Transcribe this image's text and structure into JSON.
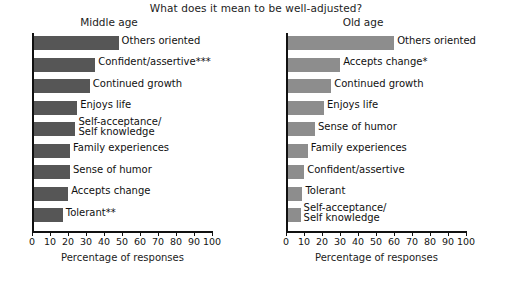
{
  "title": "What does it mean to be well-adjusted?",
  "axis": {
    "xlabel": "Percentage of responses",
    "ticks": [
      "0",
      "10",
      "20",
      "30",
      "40",
      "50",
      "60",
      "70",
      "80",
      "90",
      "100"
    ]
  },
  "panels": [
    {
      "name": "middle-age",
      "title": "Middle age",
      "bar_color": "#565656",
      "items": [
        {
          "label": "Others oriented",
          "value": 47
        },
        {
          "label": "Confident/assertive***",
          "value": 34
        },
        {
          "label": "Continued growth",
          "value": 31
        },
        {
          "label": "Enjoys life",
          "value": 24
        },
        {
          "label": "Self-acceptance/\nSelf knowledge",
          "value": 23
        },
        {
          "label": "Family experiences",
          "value": 20
        },
        {
          "label": "Sense of humor",
          "value": 20
        },
        {
          "label": "Accepts change",
          "value": 19
        },
        {
          "label": "Tolerant**",
          "value": 16
        }
      ]
    },
    {
      "name": "old-age",
      "title": "Old age",
      "bar_color": "#8d8d8d",
      "items": [
        {
          "label": "Others oriented",
          "value": 59
        },
        {
          "label": "Accepts change*",
          "value": 29
        },
        {
          "label": "Continued growth",
          "value": 24
        },
        {
          "label": "Enjoys life",
          "value": 20
        },
        {
          "label": "Sense of humor",
          "value": 15
        },
        {
          "label": "Family experiences",
          "value": 11
        },
        {
          "label": "Confident/assertive",
          "value": 9
        },
        {
          "label": "Tolerant",
          "value": 8
        },
        {
          "label": "Self-acceptance/\nSelf knowledge",
          "value": 7
        }
      ]
    }
  ],
  "chart_data": {
    "type": "bar",
    "title": "What does it mean to be well-adjusted?",
    "orientation": "horizontal",
    "xlabel": "Percentage of responses",
    "ylabel": "",
    "xlim": [
      0,
      100
    ],
    "grid": false,
    "legend": "none",
    "xticks": [
      0,
      10,
      20,
      30,
      40,
      50,
      60,
      70,
      80,
      90,
      100
    ],
    "panels": [
      {
        "title": "Middle age",
        "categories": [
          "Others oriented",
          "Confident/assertive***",
          "Continued growth",
          "Enjoys life",
          "Self-acceptance/Self knowledge",
          "Family experiences",
          "Sense of humor",
          "Accepts change",
          "Tolerant**"
        ],
        "values": [
          47,
          34,
          31,
          24,
          23,
          20,
          20,
          19,
          16
        ]
      },
      {
        "title": "Old age",
        "categories": [
          "Others oriented",
          "Accepts change*",
          "Continued growth",
          "Enjoys life",
          "Sense of humor",
          "Family experiences",
          "Confident/assertive",
          "Tolerant",
          "Self-acceptance/Self knowledge"
        ],
        "values": [
          59,
          29,
          24,
          20,
          15,
          11,
          9,
          8,
          7
        ]
      }
    ],
    "annotations": [
      "*",
      "**",
      "***"
    ]
  }
}
